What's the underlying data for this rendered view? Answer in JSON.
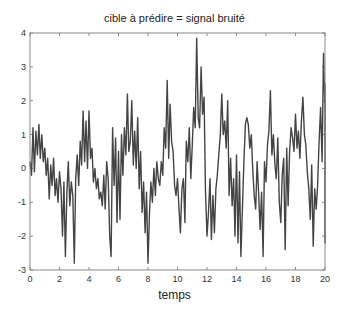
{
  "chart_data": {
    "type": "line",
    "title": "cible à prédire = signal bruité",
    "xlabel": "temps",
    "ylabel": "",
    "xlim": [
      0,
      20
    ],
    "ylim": [
      -3,
      4
    ],
    "xticks": [
      0,
      2,
      4,
      6,
      8,
      10,
      12,
      14,
      16,
      18,
      20
    ],
    "yticks": [
      -3,
      -2,
      -1,
      0,
      1,
      2,
      3,
      4
    ],
    "grid": false,
    "legend": null,
    "line_color": "#444444",
    "series": [
      {
        "name": "signal bruité",
        "x_start": 0,
        "x_step": 0.1,
        "values": [
          0.2,
          -0.2,
          1.2,
          -0.1,
          1.1,
          0.4,
          1.3,
          0.3,
          1.0,
          0.2,
          0.6,
          -0.2,
          0.3,
          -0.9,
          0.1,
          -0.5,
          0.3,
          -0.8,
          -0.3,
          -1.0,
          -0.1,
          -0.6,
          -2.0,
          -0.4,
          -2.6,
          -0.7,
          0.2,
          -1.1,
          -0.4,
          -0.8,
          -2.8,
          -0.3,
          0.4,
          -0.5,
          0.8,
          0.1,
          1.7,
          0.2,
          1.4,
          0.0,
          1.7,
          0.3,
          0.6,
          -0.4,
          0.0,
          -0.6,
          -0.3,
          -0.9,
          -0.7,
          -1.1,
          -0.2,
          -1.2,
          0.2,
          -0.3,
          -2.0,
          -2.6,
          1.2,
          -0.5,
          0.9,
          -1.6,
          0.5,
          -1.5,
          1.0,
          -0.2,
          1.2,
          0.4,
          2.2,
          0.5,
          0.8,
          2.0,
          0.1,
          1.1,
          0.0,
          1.5,
          -0.6,
          0.5,
          -1.3,
          -0.4,
          -1.9,
          -0.7,
          -2.8,
          -1.3,
          -0.4,
          -1.0,
          0.0,
          -0.8,
          0.2,
          -0.3,
          -0.5,
          0.2,
          -0.2,
          1.2,
          0.6,
          2.6,
          0.3,
          1.9,
          0.8,
          0.5,
          -0.5,
          -0.8,
          -0.3,
          -1.2,
          -1.9,
          -0.6,
          -0.3,
          -1.6,
          0.8,
          0.2,
          1.2,
          -0.3,
          0.7,
          1.8,
          1.2,
          3.85,
          1.5,
          1.2,
          3.0,
          1.6,
          2.1,
          -0.7,
          -2.0,
          -1.3,
          -0.3,
          -2.1,
          -0.8,
          -1.9,
          -0.6,
          -0.2,
          0.4,
          1.0,
          2.2,
          1.0,
          1.4,
          0.6,
          2.0,
          -0.8,
          0.3,
          -1.1,
          -0.3,
          -2.0,
          0.4,
          -2.2,
          -0.1,
          -2.6,
          -1.2,
          0.2,
          1.3,
          1.5,
          1.3,
          0.6,
          1.0,
          0.0,
          -0.8,
          -1.2,
          0.2,
          -0.7,
          -1.8,
          -0.7,
          -2.6,
          0.2,
          -0.4,
          0.7,
          1.1,
          2.3,
          0.4,
          1.0,
          0.1,
          -0.3,
          0.9,
          -1.0,
          -1.6,
          -0.2,
          0.3,
          -2.4,
          0.6,
          -1.1,
          0.5,
          1.2,
          0.9,
          0.5,
          1.6,
          0.6,
          1.1,
          0.3,
          1.4,
          2.1,
          1.0,
          0.7,
          -0.1,
          -0.6,
          -1.5,
          0.1,
          -2.3,
          -0.6,
          -1.2,
          -0.5,
          0.8,
          1.8,
          0.2,
          3.4,
          1.7,
          2.5,
          1.0,
          0.8,
          -0.7,
          0.4,
          -2.2,
          -1.5,
          -1.7,
          -1.3,
          -1.6,
          -1.3,
          0.7,
          -1.5,
          1.0,
          0.3
        ]
      }
    ]
  }
}
